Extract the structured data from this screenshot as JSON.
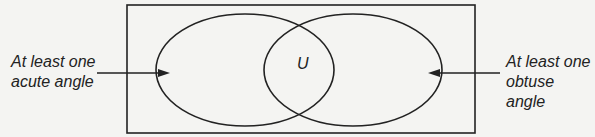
{
  "diagram": {
    "type": "venn",
    "universal_label": "U",
    "left_set_label": [
      "At least one",
      "acute angle"
    ],
    "right_set_label": [
      "At least one",
      "obtuse angle"
    ],
    "colors": {
      "stroke": "#222222",
      "background": "#f4f4f2"
    }
  }
}
